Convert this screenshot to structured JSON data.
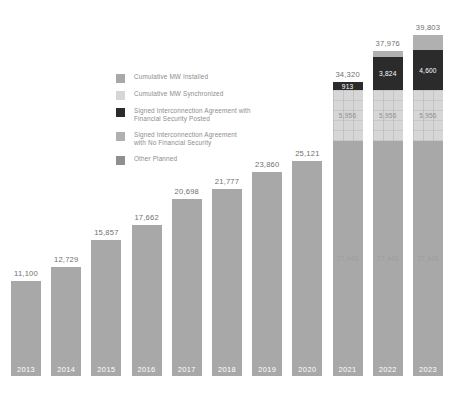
{
  "chart_data": {
    "type": "bar",
    "stacked": true,
    "title": "",
    "subtitle": "",
    "xlabel": "",
    "ylabel": "",
    "grid": false,
    "ylim": [
      0,
      39803
    ],
    "legend_position": "inside-left",
    "categories": [
      "2013",
      "2014",
      "2015",
      "2016",
      "2017",
      "2018",
      "2019",
      "2020",
      "2021",
      "2022",
      "2023"
    ],
    "totals": [
      11100,
      12729,
      15857,
      17662,
      20698,
      21777,
      23860,
      25121,
      34320,
      37976,
      39803
    ],
    "total_labels": [
      "11,100",
      "12,729",
      "15,857",
      "17,662",
      "20,698",
      "21,777",
      "23,860",
      "25,121",
      "34,320",
      "37,976",
      "39,803"
    ],
    "series": [
      {
        "name": "Cumulative MW Installed",
        "color": "#a8a8a8",
        "values": [
          11100,
          12729,
          15857,
          17662,
          20698,
          21777,
          23860,
          25121,
          27448,
          27448,
          27448
        ],
        "labels": [
          "",
          "",
          "",
          "",
          "",
          "",
          "",
          "",
          "27,448",
          "27,448",
          "27,448"
        ]
      },
      {
        "name": "Cumulative MW Synchronized",
        "color": "#d6d6d6",
        "values": [
          0,
          0,
          0,
          0,
          0,
          0,
          0,
          0,
          5956,
          5956,
          5956
        ],
        "labels": [
          "",
          "",
          "",
          "",
          "",
          "",
          "",
          "",
          "5,956",
          "5,956",
          "5,956"
        ]
      },
      {
        "name": "Signed Interconnection Agreement with\nFinancial Security Posted",
        "color": "#2b2b2b",
        "values": [
          0,
          0,
          0,
          0,
          0,
          0,
          0,
          0,
          913,
          3824,
          4600
        ],
        "labels": [
          "",
          "",
          "",
          "",
          "",
          "",
          "",
          "",
          "913",
          "3,824",
          "4,600"
        ]
      },
      {
        "name": "Signed Interconnection Agreement\nwith No Financial Security",
        "color": "#b0b0b0",
        "values": [
          0,
          0,
          0,
          0,
          0,
          0,
          0,
          0,
          3,
          748,
          1799
        ],
        "labels": [
          "",
          "",
          "",
          "",
          "",
          "",
          "",
          "",
          "",
          "748",
          "1,799"
        ]
      },
      {
        "name": "Other Planned",
        "color": "#8f8f8f",
        "values": [
          0,
          0,
          0,
          0,
          0,
          0,
          0,
          0,
          0,
          0,
          0
        ],
        "labels": [
          "",
          "",
          "",
          "",
          "",
          "",
          "",
          "",
          "",
          "",
          ""
        ]
      }
    ]
  },
  "legend": {
    "items": [
      {
        "label": "Cumulative MW Installed",
        "color": "#a8a8a8"
      },
      {
        "label": "Cumulative MW Synchronized",
        "color": "#d6d6d6"
      },
      {
        "label": "Signed Interconnection Agreement with\nFinancial Security Posted",
        "color": "#2b2b2b"
      },
      {
        "label": "Signed Interconnection Agreement\nwith No Financial Security",
        "color": "#b0b0b0"
      },
      {
        "label": "Other Planned",
        "color": "#8f8f8f"
      }
    ]
  },
  "colors": {
    "installed": "#a8a8a8",
    "synchronized": "#d6d6d6",
    "signed_financial": "#2b2b2b",
    "signed_no_financial": "#b0b0b0",
    "other_planned": "#8f8f8f",
    "background": "#ffffff",
    "total_text": "#6f6f6f",
    "year_text": "#ffffff"
  }
}
